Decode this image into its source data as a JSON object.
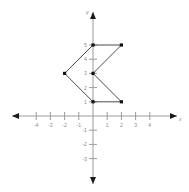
{
  "chart_data": {
    "type": "scatter",
    "title": "",
    "xlabel": "x",
    "ylabel": "y",
    "xlim": [
      -4.7,
      4.7
    ],
    "ylim": [
      -3.6,
      5.6
    ],
    "grid": false,
    "legend": null,
    "x_ticks": [
      -4,
      -3,
      -2,
      -1,
      1,
      2,
      3,
      4
    ],
    "x_tick_labels": [
      "-4",
      "-3",
      "-2",
      "-1",
      "1",
      "2",
      "3",
      "4"
    ],
    "y_ticks": [
      5,
      4,
      3,
      2,
      1,
      -1,
      -2,
      -3
    ],
    "y_tick_labels": [
      "5",
      "4",
      "3",
      "2",
      "1",
      "-1",
      "-2",
      "-3"
    ],
    "series": [
      {
        "name": "polygon",
        "closed": true,
        "marker": "square",
        "points": [
          {
            "x": 0,
            "y": 5
          },
          {
            "x": 2,
            "y": 5
          },
          {
            "x": 0,
            "y": 3
          },
          {
            "x": 2,
            "y": 1
          },
          {
            "x": 0,
            "y": 1
          },
          {
            "x": -2,
            "y": 3
          }
        ]
      }
    ]
  },
  "axes": {
    "x_label": "x",
    "y_label": "y"
  },
  "colors": {
    "axis": "#9a9a9a",
    "tick_label": "#8a8a8a",
    "shape_stroke": "#4a4a4a",
    "vertex": "#111111",
    "background": "#ffffff"
  }
}
